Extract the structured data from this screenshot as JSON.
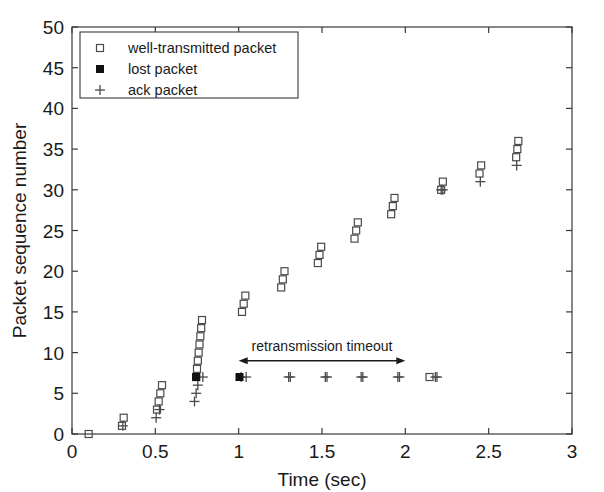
{
  "chart_data": {
    "type": "scatter",
    "title": "",
    "xlabel": "Time (sec)",
    "ylabel": "Packet sequence number",
    "xlim": [
      0,
      3
    ],
    "ylim": [
      0,
      50
    ],
    "xticks": [
      0,
      0.5,
      1,
      1.5,
      2,
      2.5,
      3
    ],
    "xticklabels": [
      "0",
      "0.5",
      "1",
      "1.5",
      "2",
      "2.5",
      "3"
    ],
    "yticks": [
      0,
      5,
      10,
      15,
      20,
      25,
      30,
      35,
      40,
      45,
      50
    ],
    "yticklabels": [
      "0",
      "5",
      "10",
      "15",
      "20",
      "25",
      "30",
      "35",
      "40",
      "45",
      "50"
    ],
    "grid": false,
    "legend_position": "upper left",
    "series": [
      {
        "name": "well-transmitted packet",
        "marker": "open-square",
        "points": [
          [
            0.1,
            0
          ],
          [
            0.3,
            1
          ],
          [
            0.31,
            2
          ],
          [
            0.51,
            3
          ],
          [
            0.52,
            4
          ],
          [
            0.53,
            5
          ],
          [
            0.54,
            6
          ],
          [
            0.745,
            7
          ],
          [
            0.75,
            8
          ],
          [
            0.755,
            9
          ],
          [
            0.76,
            10
          ],
          [
            0.765,
            11
          ],
          [
            0.77,
            12
          ],
          [
            0.775,
            13
          ],
          [
            0.78,
            14
          ],
          [
            1.02,
            15
          ],
          [
            1.03,
            16
          ],
          [
            1.04,
            17
          ],
          [
            1.255,
            18
          ],
          [
            1.265,
            19
          ],
          [
            1.275,
            20
          ],
          [
            1.475,
            21
          ],
          [
            1.485,
            22
          ],
          [
            1.495,
            23
          ],
          [
            1.695,
            24
          ],
          [
            1.705,
            25
          ],
          [
            1.715,
            26
          ],
          [
            1.915,
            27
          ],
          [
            1.925,
            28
          ],
          [
            1.935,
            29
          ],
          [
            2.145,
            7
          ],
          [
            2.215,
            30
          ],
          [
            2.225,
            31
          ],
          [
            2.445,
            32
          ],
          [
            2.455,
            33
          ],
          [
            2.665,
            34
          ],
          [
            2.672,
            35
          ],
          [
            2.678,
            36
          ]
        ]
      },
      {
        "name": "lost packet",
        "marker": "filled-square",
        "points": [
          [
            0.745,
            7
          ],
          [
            1.005,
            7
          ]
        ]
      },
      {
        "name": "ack packet",
        "marker": "plus",
        "points": [
          [
            0.305,
            1
          ],
          [
            0.505,
            2
          ],
          [
            0.525,
            3
          ],
          [
            0.735,
            4
          ],
          [
            0.745,
            5
          ],
          [
            0.755,
            6
          ],
          [
            0.785,
            7
          ],
          [
            1.015,
            7
          ],
          [
            1.045,
            7
          ],
          [
            1.3,
            7
          ],
          [
            1.31,
            7
          ],
          [
            1.52,
            7
          ],
          [
            1.53,
            7
          ],
          [
            1.735,
            7
          ],
          [
            1.745,
            7
          ],
          [
            1.955,
            7
          ],
          [
            1.965,
            7
          ],
          [
            2.18,
            7
          ],
          [
            2.19,
            7
          ],
          [
            2.215,
            30
          ],
          [
            2.225,
            30
          ],
          [
            2.45,
            31
          ],
          [
            2.668,
            33
          ]
        ]
      }
    ],
    "annotations": [
      {
        "text": "retransmission timeout",
        "type": "double-arrow",
        "x_start": 1.0,
        "x_end": 2.0,
        "y": 9.0,
        "label_y": 10.2
      }
    ]
  },
  "legend": {
    "entries": [
      {
        "label": "well-transmitted packet",
        "marker": "open-square"
      },
      {
        "label": "lost packet",
        "marker": "filled-square"
      },
      {
        "label": "ack packet",
        "marker": "plus"
      }
    ]
  },
  "colors": {
    "axis": "#3a3a3a",
    "marker_open": "#4a4a4a",
    "marker_filled": "#101010",
    "text": "#1a1a1a",
    "background": "#ffffff"
  }
}
